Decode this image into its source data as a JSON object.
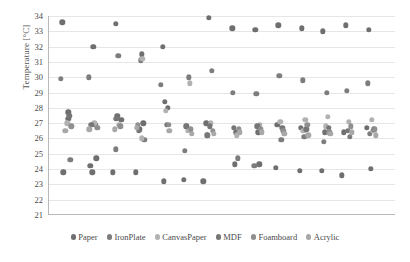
{
  "chart_data": {
    "type": "scatter",
    "title": "",
    "xlabel": "",
    "ylabel": "Temperature [°C]",
    "ylim": [
      21,
      34
    ],
    "ytick_labels": [
      "34",
      "33",
      "32",
      "31",
      "30",
      "29",
      "28",
      "27",
      "26",
      "25",
      "24",
      "23",
      "22",
      "21"
    ],
    "yticks": [
      34,
      33,
      32,
      31,
      30,
      29,
      28,
      27,
      26,
      25,
      24,
      23,
      22,
      21
    ],
    "xlim": [
      0,
      36
    ],
    "xticks_visible": false,
    "grid": "horizontal",
    "legend_position": "bottom",
    "series": [
      {
        "name": "Paper",
        "color": "#6f6f6f",
        "points": [
          {
            "x": 1.4,
            "y": 33.6
          },
          {
            "x": 2.0,
            "y": 27.7
          },
          {
            "x": 2.0,
            "y": 27.3
          },
          {
            "x": 1.5,
            "y": 23.8
          },
          {
            "x": 4.6,
            "y": 32.0
          },
          {
            "x": 4.3,
            "y": 24.2
          },
          {
            "x": 4.9,
            "y": 24.7
          },
          {
            "x": 4.5,
            "y": 23.8
          },
          {
            "x": 6.9,
            "y": 33.5
          },
          {
            "x": 7.5,
            "y": 27.2
          },
          {
            "x": 7.1,
            "y": 27.5
          },
          {
            "x": 6.6,
            "y": 23.8
          },
          {
            "x": 9.6,
            "y": 31.5
          },
          {
            "x": 9.4,
            "y": 26.6
          },
          {
            "x": 9.8,
            "y": 27.0
          },
          {
            "x": 9.0,
            "y": 23.8
          },
          {
            "x": 11.8,
            "y": 32.0
          },
          {
            "x": 12.3,
            "y": 28.0
          },
          {
            "x": 12.0,
            "y": 28.4
          },
          {
            "x": 11.9,
            "y": 23.2
          },
          {
            "x": 14.3,
            "y": 26.8
          },
          {
            "x": 14.0,
            "y": 23.3
          },
          {
            "x": 16.6,
            "y": 33.9
          },
          {
            "x": 16.3,
            "y": 27.0
          },
          {
            "x": 16.0,
            "y": 23.2
          },
          {
            "x": 19.0,
            "y": 33.2
          },
          {
            "x": 19.4,
            "y": 26.4
          },
          {
            "x": 19.3,
            "y": 24.3
          },
          {
            "x": 21.4,
            "y": 33.1
          },
          {
            "x": 21.7,
            "y": 26.4
          },
          {
            "x": 21.8,
            "y": 24.3
          },
          {
            "x": 23.8,
            "y": 33.4
          },
          {
            "x": 23.7,
            "y": 26.9
          },
          {
            "x": 23.5,
            "y": 24.1
          },
          {
            "x": 26.2,
            "y": 33.2
          },
          {
            "x": 26.1,
            "y": 26.7
          },
          {
            "x": 26.0,
            "y": 23.9
          },
          {
            "x": 28.4,
            "y": 33.0
          },
          {
            "x": 28.6,
            "y": 26.4
          },
          {
            "x": 28.3,
            "y": 23.9
          },
          {
            "x": 30.8,
            "y": 33.4
          },
          {
            "x": 30.6,
            "y": 26.4
          },
          {
            "x": 30.4,
            "y": 23.6
          },
          {
            "x": 33.2,
            "y": 33.1
          },
          {
            "x": 33.0,
            "y": 26.7
          },
          {
            "x": 33.4,
            "y": 24.0
          }
        ]
      },
      {
        "name": "IronPlate",
        "color": "#7d7d7d",
        "points": [
          {
            "x": 1.2,
            "y": 29.9
          },
          {
            "x": 2.2,
            "y": 24.6
          },
          {
            "x": 4.1,
            "y": 30.0
          },
          {
            "x": 4.8,
            "y": 26.9
          },
          {
            "x": 7.2,
            "y": 31.4
          },
          {
            "x": 6.9,
            "y": 25.3
          },
          {
            "x": 9.5,
            "y": 31.1
          },
          {
            "x": 9.9,
            "y": 25.9
          },
          {
            "x": 11.6,
            "y": 29.5
          },
          {
            "x": 14.5,
            "y": 30.0
          },
          {
            "x": 14.1,
            "y": 25.2
          },
          {
            "x": 16.9,
            "y": 30.4
          },
          {
            "x": 16.5,
            "y": 26.2
          },
          {
            "x": 19.1,
            "y": 29.0
          },
          {
            "x": 19.6,
            "y": 24.7
          },
          {
            "x": 21.5,
            "y": 28.9
          },
          {
            "x": 21.3,
            "y": 24.2
          },
          {
            "x": 23.9,
            "y": 30.1
          },
          {
            "x": 24.1,
            "y": 25.9
          },
          {
            "x": 26.3,
            "y": 29.8
          },
          {
            "x": 26.5,
            "y": 26.1
          },
          {
            "x": 28.8,
            "y": 29.0
          },
          {
            "x": 28.5,
            "y": 25.8
          },
          {
            "x": 30.9,
            "y": 29.1
          },
          {
            "x": 31.2,
            "y": 26.1
          },
          {
            "x": 33.1,
            "y": 29.6
          },
          {
            "x": 33.3,
            "y": 26.3
          }
        ]
      },
      {
        "name": "CanvasPaper",
        "color": "#b2b2b2",
        "points": [
          {
            "x": 1.9,
            "y": 27.0
          },
          {
            "x": 4.7,
            "y": 27.0
          },
          {
            "x": 7.3,
            "y": 26.9
          },
          {
            "x": 9.7,
            "y": 31.2
          },
          {
            "x": 9.6,
            "y": 26.0
          },
          {
            "x": 12.1,
            "y": 27.8
          },
          {
            "x": 14.6,
            "y": 29.6
          },
          {
            "x": 14.4,
            "y": 26.5
          },
          {
            "x": 16.8,
            "y": 27.0
          },
          {
            "x": 19.5,
            "y": 26.2
          },
          {
            "x": 21.9,
            "y": 26.9
          },
          {
            "x": 24.0,
            "y": 27.1
          },
          {
            "x": 26.6,
            "y": 27.2
          },
          {
            "x": 26.4,
            "y": 26.5
          },
          {
            "x": 28.9,
            "y": 27.4
          },
          {
            "x": 28.7,
            "y": 26.8
          },
          {
            "x": 31.1,
            "y": 27.1
          },
          {
            "x": 33.5,
            "y": 27.2
          },
          {
            "x": 33.6,
            "y": 26.5
          }
        ]
      },
      {
        "name": "MDF",
        "color": "#767676",
        "points": [
          {
            "x": 2.1,
            "y": 27.5
          },
          {
            "x": 4.4,
            "y": 26.9
          },
          {
            "x": 7.0,
            "y": 27.3
          },
          {
            "x": 9.3,
            "y": 26.5
          },
          {
            "x": 12.2,
            "y": 26.9
          },
          {
            "x": 14.2,
            "y": 26.8
          },
          {
            "x": 16.7,
            "y": 26.8
          },
          {
            "x": 16.4,
            "y": 26.2
          },
          {
            "x": 19.2,
            "y": 26.7
          },
          {
            "x": 21.6,
            "y": 26.8
          },
          {
            "x": 24.2,
            "y": 26.7
          },
          {
            "x": 26.7,
            "y": 26.6
          },
          {
            "x": 29.0,
            "y": 26.7
          },
          {
            "x": 31.0,
            "y": 26.5
          },
          {
            "x": 33.7,
            "y": 26.6
          }
        ]
      },
      {
        "name": "Foamboard",
        "color": "#8f8f8f",
        "points": [
          {
            "x": 2.3,
            "y": 26.8
          },
          {
            "x": 5.0,
            "y": 26.7
          },
          {
            "x": 7.4,
            "y": 26.8
          },
          {
            "x": 9.2,
            "y": 26.9
          },
          {
            "x": 12.4,
            "y": 26.9
          },
          {
            "x": 14.7,
            "y": 26.6
          },
          {
            "x": 17.0,
            "y": 26.5
          },
          {
            "x": 19.7,
            "y": 26.6
          },
          {
            "x": 22.0,
            "y": 26.6
          },
          {
            "x": 24.3,
            "y": 26.5
          },
          {
            "x": 26.8,
            "y": 26.9
          },
          {
            "x": 29.1,
            "y": 26.4
          },
          {
            "x": 31.3,
            "y": 26.8
          },
          {
            "x": 33.8,
            "y": 26.6
          }
        ]
      },
      {
        "name": "Acrylic",
        "color": "#a8a8a8",
        "points": [
          {
            "x": 1.7,
            "y": 26.5
          },
          {
            "x": 4.2,
            "y": 26.6
          },
          {
            "x": 6.8,
            "y": 26.6
          },
          {
            "x": 9.1,
            "y": 26.7
          },
          {
            "x": 12.5,
            "y": 26.5
          },
          {
            "x": 14.8,
            "y": 26.3
          },
          {
            "x": 17.1,
            "y": 26.3
          },
          {
            "x": 19.8,
            "y": 26.4
          },
          {
            "x": 22.1,
            "y": 26.4
          },
          {
            "x": 24.4,
            "y": 26.3
          },
          {
            "x": 26.9,
            "y": 26.2
          },
          {
            "x": 29.2,
            "y": 26.3
          },
          {
            "x": 31.4,
            "y": 26.4
          },
          {
            "x": 33.9,
            "y": 26.2
          }
        ]
      }
    ]
  }
}
